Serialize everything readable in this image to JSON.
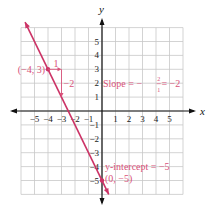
{
  "chart_data": {
    "type": "line",
    "title": "",
    "xlabel": "x",
    "ylabel": "y",
    "xlim": [
      -6,
      6
    ],
    "ylim": [
      -6,
      6
    ],
    "grid": true,
    "x_ticks": [
      -5,
      -4,
      -3,
      -2,
      -1,
      1,
      2,
      3,
      4,
      5
    ],
    "y_ticks": [
      -5,
      -4,
      -3,
      -2,
      -1,
      1,
      2,
      3,
      4,
      5
    ],
    "x_tick_labels": [
      "−5",
      "−4",
      "−3",
      "−2",
      "−1",
      "1",
      "2",
      "3",
      "4",
      "5"
    ],
    "y_tick_labels": [
      "−5",
      "−4",
      "−3",
      "−2",
      "−1",
      "1",
      "2",
      "3",
      "4",
      "5"
    ],
    "series": [
      {
        "name": "y = −2x − 5",
        "slope": -2,
        "intercept": -5,
        "x": [
          -5.7,
          0.5
        ],
        "y": [
          6.4,
          -6.0
        ],
        "color": "#cc3366"
      }
    ],
    "points": [
      {
        "x": -4,
        "y": 3,
        "label": "(−4, 3)"
      },
      {
        "x": 0,
        "y": -5,
        "label": "(0, −5)"
      }
    ],
    "annotations": {
      "run_label": "1",
      "rise_label": "−2",
      "slope_text": "Slope = −",
      "slope_num": "2",
      "slope_den": "1",
      "slope_tail": " = −2",
      "intercept_text": "y-intercept = −5"
    }
  },
  "colors": {
    "line": "#cc3366",
    "annotation": "#d9527a",
    "grid": "#c8c8c8",
    "axis": "#111111"
  }
}
